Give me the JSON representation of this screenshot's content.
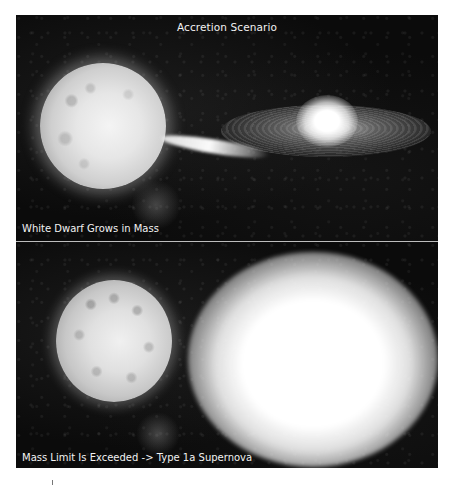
{
  "figure": {
    "title": "Accretion Scenario",
    "panels": [
      {
        "id": "top",
        "caption": "White Dwarf Grows in Mass",
        "depicts": [
          "companion-star",
          "mass-transfer-stream",
          "accretion-disk",
          "white-dwarf"
        ]
      },
      {
        "id": "bottom",
        "caption": "Mass Limit Is Exceeded -> Type 1a Supernova",
        "depicts": [
          "companion-star",
          "supernova-explosion"
        ]
      }
    ],
    "colors": {
      "background": "#0b0b0b",
      "text": "#f2f2f2",
      "divider": "#bdbdbd",
      "page": "#ffffff"
    }
  }
}
